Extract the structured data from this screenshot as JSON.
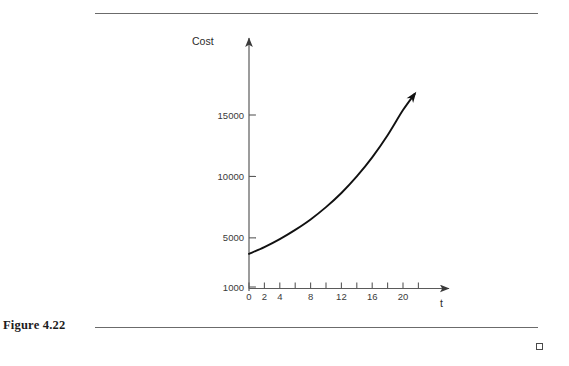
{
  "page": {
    "background_color": "#ffffff",
    "rule_color": "#6b6b6b",
    "ink_color": "#1a1a1a"
  },
  "caption": {
    "text": "Figure 4.22"
  },
  "end_marker": {
    "name": "end-of-proof-square",
    "symbol": ""
  },
  "chart_data": {
    "type": "line",
    "title": "",
    "xlabel": "t",
    "ylabel": "Cost",
    "x": [
      0,
      2,
      4,
      6,
      8,
      10,
      12,
      14,
      16,
      18,
      20,
      21.5
    ],
    "values": [
      3700,
      4250,
      4900,
      5650,
      6500,
      7500,
      8650,
      10000,
      11550,
      13350,
      15400,
      16700
    ],
    "xlim": [
      0,
      24
    ],
    "ylim": [
      0,
      19000
    ],
    "xticks": [
      0,
      2,
      4,
      6,
      8,
      10,
      12,
      14,
      16,
      18,
      20,
      22
    ],
    "xtick_labels": [
      "0",
      "2",
      "4",
      "",
      "8",
      "",
      "12",
      "",
      "16",
      "",
      "20",
      ""
    ],
    "yticks": [
      1000,
      5000,
      10000,
      15000
    ],
    "ytick_labels": [
      "1000",
      "5000",
      "10000",
      "15000"
    ],
    "grid": false,
    "legend": null,
    "curve_arrowhead": true,
    "axis_arrowheads": [
      "x-axis-right",
      "y-axis-top"
    ],
    "line_color": "#111111",
    "axis_color": "#5a5a5a"
  }
}
